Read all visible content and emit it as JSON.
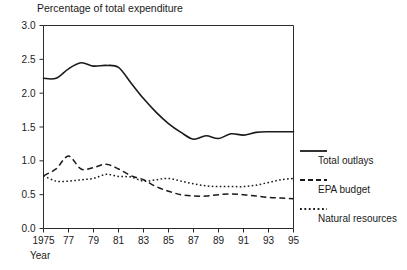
{
  "chart_data": {
    "type": "line",
    "title": "Percentage of total expenditure",
    "xlabel": "Year",
    "ylabel": "",
    "xlim": [
      1975,
      1995
    ],
    "ylim": [
      0.0,
      3.0
    ],
    "grid": false,
    "legend_position": "right",
    "xticks": [
      "1975",
      "77",
      "79",
      "81",
      "83",
      "85",
      "87",
      "89",
      "91",
      "93",
      "95"
    ],
    "xtick_values": [
      1975,
      1977,
      1979,
      1981,
      1983,
      1985,
      1987,
      1989,
      1991,
      1993,
      1995
    ],
    "yticks": [
      "0.0",
      "0.5",
      "1.0",
      "1.5",
      "2.0",
      "2.5",
      "3.0"
    ],
    "ytick_values": [
      0.0,
      0.5,
      1.0,
      1.5,
      2.0,
      2.5,
      3.0
    ],
    "x": [
      1975,
      1976,
      1977,
      1978,
      1979,
      1980,
      1981,
      1982,
      1983,
      1984,
      1985,
      1986,
      1987,
      1988,
      1989,
      1990,
      1991,
      1992,
      1993,
      1994,
      1995
    ],
    "series": [
      {
        "name": "Total outlays",
        "style": "solid",
        "color": "#1a1a1a",
        "values": [
          2.22,
          2.22,
          2.36,
          2.45,
          2.4,
          2.41,
          2.38,
          2.15,
          1.92,
          1.72,
          1.55,
          1.42,
          1.32,
          1.37,
          1.33,
          1.4,
          1.38,
          1.42,
          1.43,
          1.43,
          1.43
        ]
      },
      {
        "name": "EPA budget",
        "style": "dashed",
        "color": "#1a1a1a",
        "values": [
          0.78,
          0.88,
          1.07,
          0.88,
          0.9,
          0.95,
          0.88,
          0.78,
          0.72,
          0.62,
          0.55,
          0.5,
          0.48,
          0.48,
          0.5,
          0.51,
          0.5,
          0.48,
          0.46,
          0.45,
          0.44
        ]
      },
      {
        "name": "Natural resources",
        "style": "dotted",
        "color": "#1a1a1a",
        "values": [
          0.78,
          0.7,
          0.7,
          0.72,
          0.74,
          0.8,
          0.77,
          0.76,
          0.7,
          0.72,
          0.74,
          0.7,
          0.66,
          0.63,
          0.62,
          0.62,
          0.62,
          0.64,
          0.68,
          0.72,
          0.74
        ]
      }
    ]
  },
  "legend": {
    "items": [
      {
        "label": "Total outlays",
        "style": "solid"
      },
      {
        "label": "EPA budget",
        "style": "dashed"
      },
      {
        "label": "Natural resources",
        "style": "dotted"
      }
    ]
  }
}
